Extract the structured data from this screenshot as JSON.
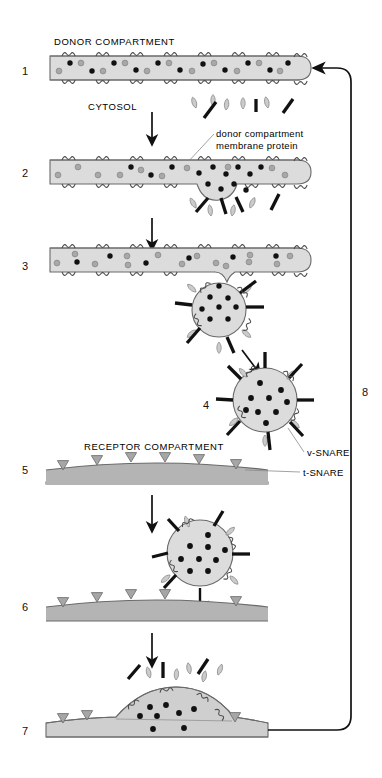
{
  "figure": {
    "title_donor": "DONOR COMPARTMENT",
    "label_cytosol": "CYTOSOL",
    "label_membrane_protein_line1": "donor compartment",
    "label_membrane_protein_line2": "membrane protein",
    "label_receptor": "RECEPTOR COMPARTMENT",
    "label_vsnare": "v-SNARE",
    "label_tsnare": "t-SNARE",
    "steps": [
      {
        "id": "1",
        "label": "1"
      },
      {
        "id": "2",
        "label": "2"
      },
      {
        "id": "3",
        "label": "3"
      },
      {
        "id": "4",
        "label": "4"
      },
      {
        "id": "5",
        "label": "5"
      },
      {
        "id": "6",
        "label": "6"
      },
      {
        "id": "7",
        "label": "7"
      },
      {
        "id": "8",
        "label": "8"
      }
    ],
    "colors": {
      "lumen_fill": "#dcdcdc",
      "membrane_line": "#555555",
      "cargo_dot": "#111111",
      "membrane_protein": "#9a9a9a",
      "coat_protein": "#c8c8c8",
      "vsnare_spike": "#111111",
      "tsnare_triangle": "#9a9a9a",
      "receptor_fill": "#b4b4b4",
      "arrow": "#111111",
      "background": "#ffffff"
    }
  }
}
